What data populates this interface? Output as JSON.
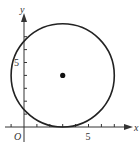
{
  "figure": {
    "type": "coordinate-plane-circle",
    "axes": {
      "x_label": "x",
      "y_label": "y",
      "origin_label": "O",
      "x_tick_label": "5",
      "y_tick_label": "5",
      "x_ticks": [
        -1,
        1,
        2,
        3,
        4,
        5,
        6,
        7,
        8
      ],
      "y_ticks": [
        1,
        2,
        3,
        4,
        5,
        6,
        7
      ]
    },
    "circle": {
      "center": [
        3,
        4
      ],
      "radius": 4,
      "stroke_color": "#222222"
    },
    "center_point": {
      "coords": [
        3,
        4
      ],
      "color": "#111111"
    }
  }
}
